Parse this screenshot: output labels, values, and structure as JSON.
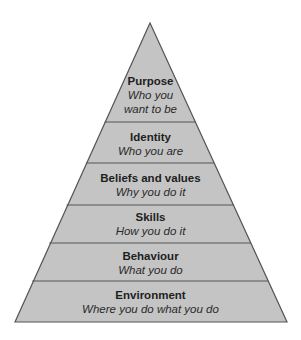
{
  "diagram": {
    "type": "pyramid",
    "fill_color": "#c4c4c4",
    "line_color": "#555555",
    "levels": [
      {
        "title": "Purpose",
        "subtitle_line1": "Who you",
        "subtitle_line2": "want to be"
      },
      {
        "title": "Identity",
        "subtitle": "Who you are"
      },
      {
        "title": "Beliefs and values",
        "subtitle": "Why you do it"
      },
      {
        "title": "Skills",
        "subtitle": "How you do it"
      },
      {
        "title": "Behaviour",
        "subtitle": "What you do"
      },
      {
        "title": "Environment",
        "subtitle": "Where you do what you do"
      }
    ]
  }
}
